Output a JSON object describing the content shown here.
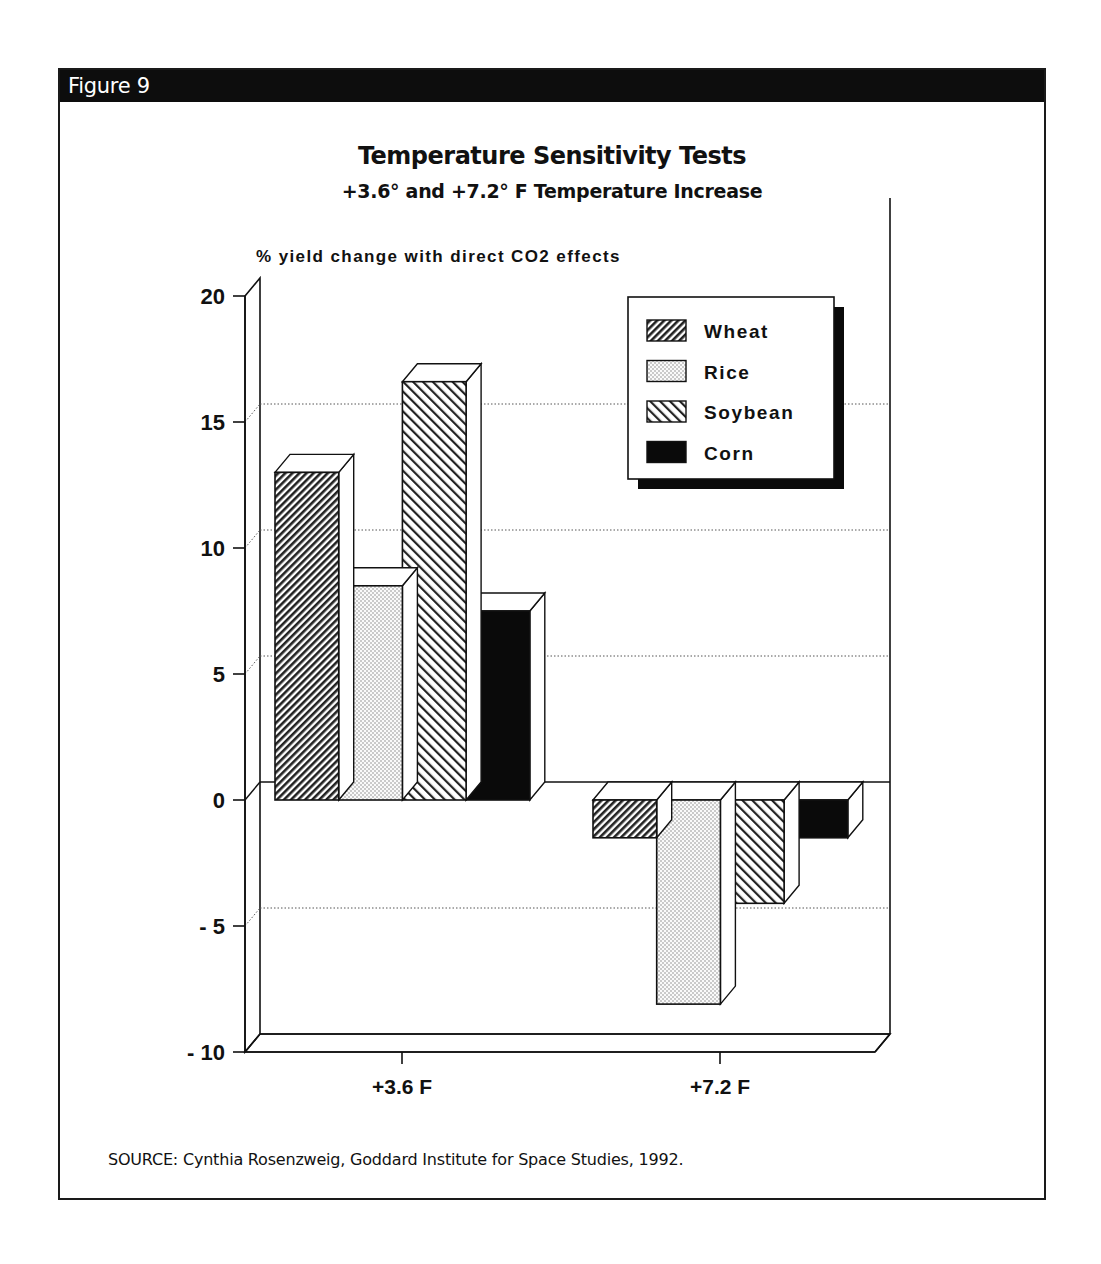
{
  "figure": {
    "label": "Figure 9",
    "title": "Temperature Sensitivity Tests",
    "subtitle": "+3.6° and +7.2° F Temperature Increase",
    "ylabel": "% yield change with direct CO2 effects",
    "source": "SOURCE:   Cynthia Rosenzweig, Goddard Institute for Space Studies, 1992."
  },
  "colors": {
    "header_bg": "#0d0d0d",
    "ink": "#111111",
    "gridline": "#555555",
    "corn_fill": "#0a0a0a"
  },
  "legend": {
    "items": [
      {
        "label": "Wheat",
        "pattern": "dense-diagonal-hatch"
      },
      {
        "label": "Rice",
        "pattern": "dotted"
      },
      {
        "label": "Soybean",
        "pattern": "sparse-diagonal-hatch"
      },
      {
        "label": "Corn",
        "pattern": "solid-black"
      }
    ]
  },
  "chart_data": {
    "type": "bar",
    "style": "3d-grouped",
    "title": "Temperature Sensitivity Tests",
    "subtitle": "+3.6° and +7.2° F Temperature Increase",
    "xlabel": "",
    "ylabel": "% yield change with direct CO2 effects",
    "categories": [
      "+3.6 F",
      "+7.2 F"
    ],
    "series": [
      {
        "name": "Wheat",
        "values": [
          13.0,
          -1.5
        ]
      },
      {
        "name": "Rice",
        "values": [
          8.5,
          -8.1
        ]
      },
      {
        "name": "Soybean",
        "values": [
          16.6,
          -4.1
        ]
      },
      {
        "name": "Corn",
        "values": [
          7.5,
          -1.5
        ]
      }
    ],
    "ylim": [
      -10,
      20
    ],
    "yticks": [
      -10,
      -5,
      0,
      5,
      10,
      15,
      20
    ],
    "ytick_labels": [
      "-10",
      "-5",
      "0",
      "5",
      "10",
      "15",
      "20"
    ],
    "grid": "dotted horizontal at 15, 10, 5, -5",
    "legend_position": "upper right, inside plot, drop shadow"
  }
}
